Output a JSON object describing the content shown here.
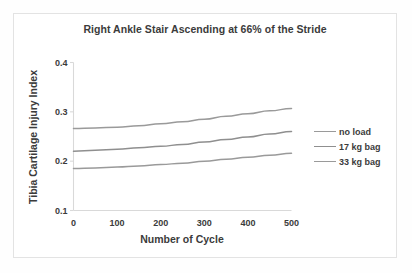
{
  "chart_data": {
    "type": "line",
    "title": "Right Ankle Stair Ascending at 66% of the Stride",
    "subtitle": "",
    "xlabel": "Number of Cycle",
    "ylabel": "Tibia Cartilage Injury Index",
    "xlim": [
      0,
      500
    ],
    "ylim": [
      0.1,
      0.4
    ],
    "xticks": [
      "0",
      "100",
      "200",
      "300",
      "400",
      "500"
    ],
    "xtick_values": [
      0,
      100,
      200,
      300,
      400,
      500
    ],
    "yticks": [
      "0.1",
      "0.2",
      "0.3",
      "0.4"
    ],
    "ytick_values": [
      0.1,
      0.2,
      0.3,
      0.4
    ],
    "grid": false,
    "legend_position": "right",
    "x": [
      0,
      50,
      100,
      150,
      200,
      250,
      300,
      350,
      400,
      450,
      500
    ],
    "series": [
      {
        "name": "no load",
        "color": "#9a9a9a",
        "values": [
          0.185,
          0.186,
          0.188,
          0.19,
          0.193,
          0.196,
          0.2,
          0.204,
          0.208,
          0.212,
          0.216
        ]
      },
      {
        "name": "17 kg bag",
        "color": "#8f8f8f",
        "values": [
          0.22,
          0.222,
          0.224,
          0.227,
          0.23,
          0.234,
          0.239,
          0.244,
          0.249,
          0.255,
          0.26
        ]
      },
      {
        "name": "33 kg bag",
        "color": "#9a9a9a",
        "values": [
          0.266,
          0.267,
          0.269,
          0.272,
          0.276,
          0.28,
          0.285,
          0.291,
          0.296,
          0.302,
          0.307
        ]
      }
    ]
  },
  "legend": {
    "entries": [
      {
        "label": "no load",
        "color": "#9a9a9a"
      },
      {
        "label": "17 kg bag",
        "color": "#8f8f8f"
      },
      {
        "label": "33 kg bag",
        "color": "#9a9a9a"
      }
    ]
  },
  "style": {
    "axis_color": "#d9d9d9",
    "frame_color": "#e3e3e3",
    "text_color": "#3b3b3b",
    "background": "#ffffff"
  }
}
